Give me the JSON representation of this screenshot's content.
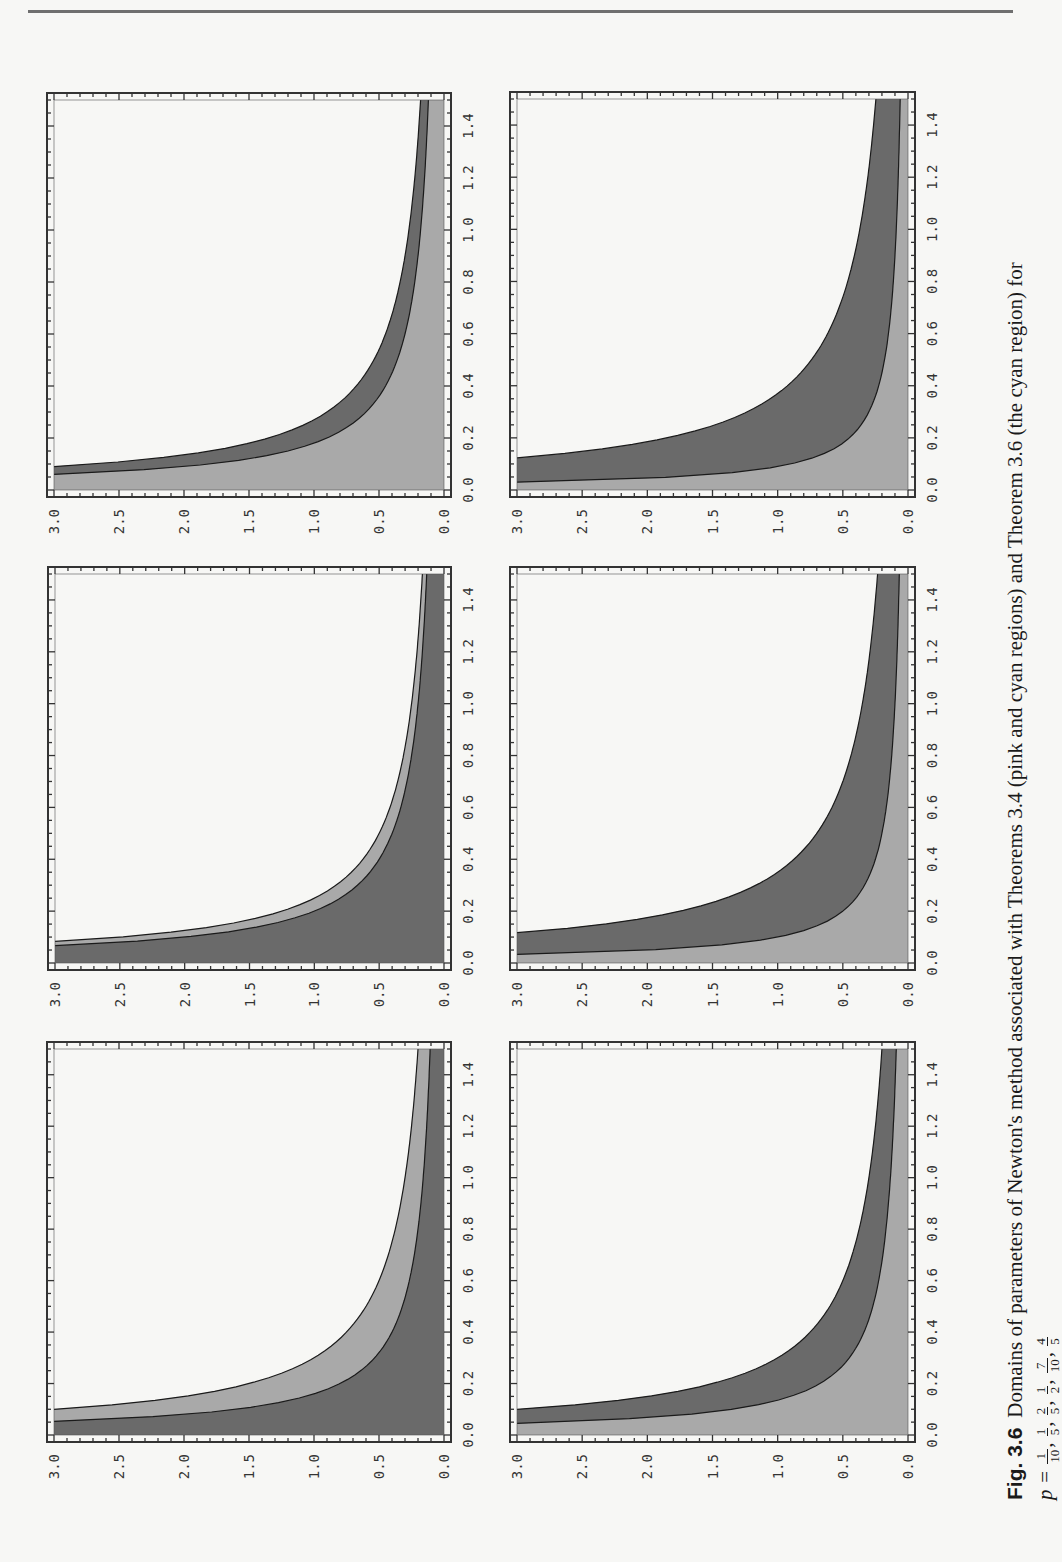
{
  "page": {
    "orientation": "landscape-rotated-90ccw"
  },
  "caption": {
    "label": "Fig. 3.6",
    "text": "Domains of parameters of Newton's method associated with Theorems 3.4 (pink and cyan regions) and Theorem 3.6 (the cyan region) for",
    "p_prefix": "p =",
    "p_values": [
      {
        "num": "1",
        "den": "10"
      },
      {
        "num": "1",
        "den": "5"
      },
      {
        "num": "2",
        "den": "5"
      },
      {
        "num": "1",
        "den": "2"
      },
      {
        "num": "7",
        "den": "10"
      },
      {
        "num": "4",
        "den": "5"
      }
    ]
  },
  "colors": {
    "dark_region": "#6a6a6a",
    "light_region": "#a9a9a9",
    "frame": "#333333",
    "curve": "#1a1a1a"
  },
  "chart_data": [
    {
      "type": "area",
      "panel": "p=1/10",
      "xlim": [
        0,
        1.5
      ],
      "ylim": [
        0,
        3.0
      ],
      "xticks": [
        "0.0",
        "0.2",
        "0.4",
        "0.6",
        "0.8",
        "1.0",
        "1.2",
        "1.4"
      ],
      "yticks": [
        "0.0",
        "0.5",
        "1.0",
        "1.5",
        "2.0",
        "2.5",
        "3.0"
      ],
      "regions": [
        {
          "name": "inner",
          "shade": "dark",
          "curve_constant": 0.16
        },
        {
          "name": "band",
          "shade": "light",
          "curve_constant": 0.3
        }
      ]
    },
    {
      "type": "area",
      "panel": "p=1/5",
      "xlim": [
        0,
        1.5
      ],
      "ylim": [
        0,
        3.0
      ],
      "xticks": [
        "0.0",
        "0.2",
        "0.4",
        "0.6",
        "0.8",
        "1.0",
        "1.2",
        "1.4"
      ],
      "yticks": [
        "0.0",
        "0.5",
        "1.0",
        "1.5",
        "2.0",
        "2.5",
        "3.0"
      ],
      "regions": [
        {
          "name": "inner",
          "shade": "dark",
          "curve_constant": 0.2
        },
        {
          "name": "band",
          "shade": "light",
          "curve_constant": 0.25
        }
      ]
    },
    {
      "type": "area",
      "panel": "p=2/5",
      "xlim": [
        0,
        1.5
      ],
      "ylim": [
        0,
        3.0
      ],
      "xticks": [
        "0.0",
        "0.2",
        "0.4",
        "0.6",
        "0.8",
        "1.0",
        "1.2",
        "1.4"
      ],
      "yticks": [
        "0.0",
        "0.5",
        "1.0",
        "1.5",
        "2.0",
        "2.5",
        "3.0"
      ],
      "regions": [
        {
          "name": "inner",
          "shade": "light",
          "curve_constant": 0.18
        },
        {
          "name": "band",
          "shade": "dark",
          "curve_constant": 0.27
        }
      ]
    },
    {
      "type": "area",
      "panel": "p=1/2",
      "xlim": [
        0,
        1.5
      ],
      "ylim": [
        0,
        3.0
      ],
      "xticks": [
        "0.0",
        "0.2",
        "0.4",
        "0.6",
        "0.8",
        "1.0",
        "1.2",
        "1.4"
      ],
      "yticks": [
        "0.0",
        "0.5",
        "1.0",
        "1.5",
        "2.0",
        "2.5",
        "3.0"
      ],
      "regions": [
        {
          "name": "inner",
          "shade": "light",
          "curve_constant": 0.135
        },
        {
          "name": "band",
          "shade": "dark",
          "curve_constant": 0.3
        }
      ]
    },
    {
      "type": "area",
      "panel": "p=7/10",
      "xlim": [
        0,
        1.5
      ],
      "ylim": [
        0,
        3.0
      ],
      "xticks": [
        "0.0",
        "0.2",
        "0.4",
        "0.6",
        "0.8",
        "1.0",
        "1.2",
        "1.4"
      ],
      "yticks": [
        "0.0",
        "0.5",
        "1.0",
        "1.5",
        "2.0",
        "2.5",
        "3.0"
      ],
      "regions": [
        {
          "name": "inner",
          "shade": "light",
          "curve_constant": 0.1
        },
        {
          "name": "band",
          "shade": "dark",
          "curve_constant": 0.35
        }
      ]
    },
    {
      "type": "area",
      "panel": "p=4/5",
      "xlim": [
        0,
        1.5
      ],
      "ylim": [
        0,
        3.0
      ],
      "xticks": [
        "0.0",
        "0.2",
        "0.4",
        "0.6",
        "0.8",
        "1.0",
        "1.2",
        "1.4"
      ],
      "yticks": [
        "0.0",
        "0.5",
        "1.0",
        "1.5",
        "2.0",
        "2.5",
        "3.0"
      ],
      "regions": [
        {
          "name": "inner",
          "shade": "light",
          "curve_constant": 0.09
        },
        {
          "name": "band",
          "shade": "dark",
          "curve_constant": 0.37
        }
      ]
    }
  ]
}
